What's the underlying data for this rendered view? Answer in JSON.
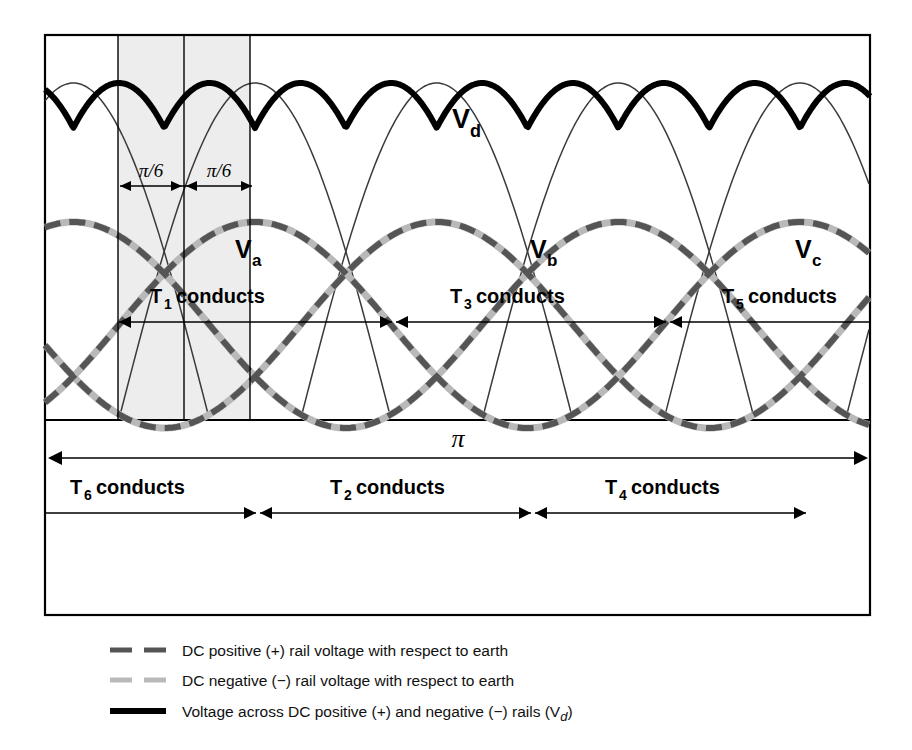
{
  "figure": {
    "frame": {
      "x": 45,
      "y": 35,
      "width": 825,
      "height": 580
    }
  },
  "labels": {
    "vd": "V",
    "vd_sub": "d",
    "va": "V",
    "va_sub": "a",
    "vb": "V",
    "vb_sub": "b",
    "vc": "V",
    "vc_sub": "c",
    "pi_over_six_left": "π/6",
    "pi_over_six_right": "π/6",
    "pi_span": "π"
  },
  "conduction_upper": [
    {
      "device": "T",
      "sub": "1",
      "text": "conducts"
    },
    {
      "device": "T",
      "sub": "3",
      "text": "conducts"
    },
    {
      "device": "T",
      "sub": "5",
      "text": "conducts"
    }
  ],
  "conduction_lower": [
    {
      "device": "T",
      "sub": "6",
      "text": "conducts"
    },
    {
      "device": "T",
      "sub": "2",
      "text": "conducts"
    },
    {
      "device": "T",
      "sub": "4",
      "text": "conducts"
    }
  ],
  "legend": [
    {
      "style": "dashed",
      "color": "#555555",
      "text": "DC positive (+) rail voltage with respect to earth"
    },
    {
      "style": "dashed",
      "color": "#b9b9b9",
      "text": "DC negative (−) rail voltage with respect to earth"
    },
    {
      "style": "solid",
      "color": "#000000",
      "text": "Voltage across DC positive (+) and negative (−) rails (V",
      "text_sub": "d",
      "text_tail": ")"
    }
  ],
  "colors": {
    "vd_trace": "#000000",
    "positive_rail": "#555555",
    "negative_rail": "#b9b9b9",
    "thin_envelope": "#3a3a3a",
    "shaded_region": "#ededed",
    "frame_stroke": "#000000"
  },
  "chart_data": {
    "type": "line",
    "xlabel": "",
    "ylabel": "",
    "x_range_radians": [
      0,
      6.283185
    ],
    "grid": false,
    "legend_position": "bottom",
    "annotations": [
      {
        "text": "π/6",
        "x_radians": 0.2618,
        "note": "half-interval left of Va peak"
      },
      {
        "text": "π/6",
        "x_radians": 0.7854,
        "note": "half-interval right of Va peak"
      },
      {
        "text": "π",
        "note": "full span arrow across lower section"
      }
    ],
    "series": [
      {
        "name": "V_a",
        "type": "sine",
        "phase_deg": 0,
        "amplitude": 1.0,
        "style": "dashed",
        "color": "#555555"
      },
      {
        "name": "V_b",
        "type": "sine",
        "phase_deg": -120,
        "amplitude": 1.0,
        "style": "dashed",
        "color": "#555555"
      },
      {
        "name": "V_c",
        "type": "sine",
        "phase_deg": -240,
        "amplitude": 1.0,
        "style": "dashed",
        "color": "#555555"
      },
      {
        "name": "V_d",
        "type": "six-pulse-rectified",
        "amplitude": 1.732,
        "style": "solid",
        "color": "#000000",
        "ripple_peak": 1.0,
        "ripple_valley": 0.866
      }
    ],
    "conduction_sequence_upper": [
      "T1",
      "T3",
      "T5"
    ],
    "conduction_sequence_lower": [
      "T6",
      "T2",
      "T4"
    ]
  }
}
